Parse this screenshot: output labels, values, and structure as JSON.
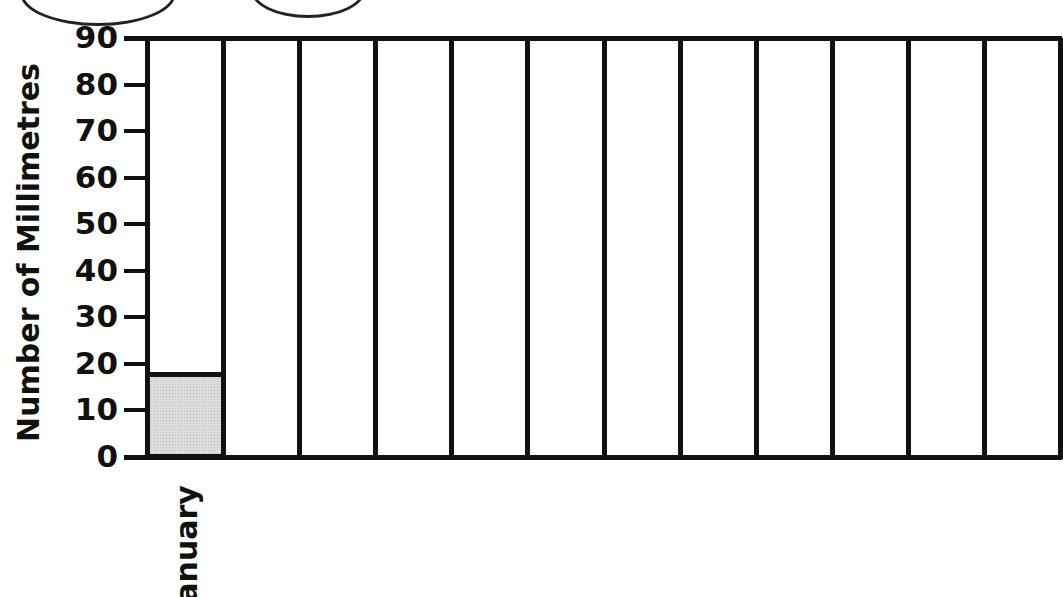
{
  "chart_data": {
    "type": "bar",
    "title": "",
    "xlabel": "",
    "ylabel": "Number of Millimetres",
    "ylim": [
      0,
      90
    ],
    "yticks": [
      0,
      10,
      20,
      30,
      40,
      50,
      60,
      70,
      80,
      90
    ],
    "categories": [
      "January",
      "",
      "",
      "",
      "",
      "",
      "",
      "",
      "",
      "",
      "",
      ""
    ],
    "values": [
      18,
      null,
      null,
      null,
      null,
      null,
      null,
      null,
      null,
      null,
      null,
      null
    ],
    "grid": true,
    "legend": null,
    "bar_fill": "#dcdcdc",
    "line_color": "#111111"
  },
  "axis": {
    "ylabel": "Number of Millimetres",
    "ytick_labels": [
      "0",
      "10",
      "20",
      "30",
      "40",
      "50",
      "60",
      "70",
      "80",
      "90"
    ]
  },
  "columns": [
    {
      "label": "January",
      "value": 18
    },
    {
      "label": "",
      "value": null
    },
    {
      "label": "",
      "value": null
    },
    {
      "label": "",
      "value": null
    },
    {
      "label": "",
      "value": null
    },
    {
      "label": "",
      "value": null
    },
    {
      "label": "",
      "value": null
    },
    {
      "label": "",
      "value": null
    },
    {
      "label": "",
      "value": null
    },
    {
      "label": "",
      "value": null
    },
    {
      "label": "",
      "value": null
    },
    {
      "label": "",
      "value": null
    }
  ]
}
